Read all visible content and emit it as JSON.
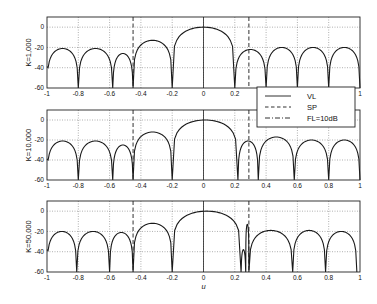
{
  "chart_data": [
    {
      "type": "line",
      "panel": 1,
      "ylabel": "K=1,000",
      "xlabel": "",
      "xlim": [
        -1,
        1
      ],
      "ylim": [
        -60,
        10
      ],
      "xticks": [
        -1,
        -0.8,
        -0.6,
        -0.4,
        -0.2,
        0,
        0.2,
        0.4,
        0.6,
        0.8,
        1
      ],
      "xtick_labels": [
        "-1",
        "-0.8",
        "-0.6",
        "-0.4",
        "-0.2",
        "0",
        "0.2",
        "0.4",
        "0.6",
        "0.8",
        "1"
      ],
      "yticks": [
        -60,
        -40,
        -20,
        0
      ],
      "ytick_labels": [
        "-60",
        "-40",
        "-20",
        "0"
      ],
      "grid": true,
      "vertical_markers": [
        {
          "x": -0.45,
          "style": "SP"
        },
        {
          "x": 0.29,
          "style": "SP"
        }
      ],
      "nulls_u": [
        -1,
        -0.8,
        -0.58,
        -0.45,
        -0.2,
        0.2,
        0.4,
        0.6,
        0.8,
        1
      ],
      "lobe_peaks_db": [
        -21,
        -21,
        -26,
        -13,
        0,
        -22,
        -20,
        -20,
        -20
      ],
      "series": [
        {
          "name": "VL",
          "style": "solid"
        }
      ]
    },
    {
      "type": "line",
      "panel": 2,
      "ylabel": "K=10,000",
      "xlabel": "",
      "xlim": [
        -1,
        1
      ],
      "ylim": [
        -60,
        10
      ],
      "xticks": [
        -1,
        -0.8,
        -0.6,
        -0.4,
        -0.2,
        0,
        0.2,
        0.4,
        0.6,
        0.8,
        1
      ],
      "xtick_labels": [
        "-1",
        "-0.8",
        "-0.6",
        "-0.4",
        "-0.2",
        "0",
        "0.2",
        "0.4",
        "0.6",
        "0.8",
        "1"
      ],
      "yticks": [
        -60,
        -40,
        -20,
        0
      ],
      "ytick_labels": [
        "-60",
        "-40",
        "-20",
        "0"
      ],
      "grid": true,
      "vertical_markers": [
        {
          "x": -0.45,
          "style": "SP"
        },
        {
          "x": 0.29,
          "style": "SP"
        }
      ],
      "nulls_u": [
        -1,
        -0.8,
        -0.58,
        -0.45,
        -0.2,
        0.22,
        0.35,
        0.58,
        0.8,
        1
      ],
      "lobe_peaks_db": [
        -21,
        -21,
        -25,
        -12,
        0,
        -21,
        -17,
        -20,
        -20
      ],
      "series": [
        {
          "name": "VL",
          "style": "solid"
        }
      ]
    },
    {
      "type": "line",
      "panel": 3,
      "ylabel": "K=50,000",
      "xlabel": "u",
      "xlim": [
        -1,
        1
      ],
      "ylim": [
        -60,
        10
      ],
      "xticks": [
        -1,
        -0.8,
        -0.6,
        -0.4,
        -0.2,
        0,
        0.2,
        0.4,
        0.6,
        0.8,
        1
      ],
      "xtick_labels": [
        "-1",
        "-0.8",
        "-0.6",
        "-0.4",
        "-0.2",
        "0",
        "0.2",
        "0.4",
        "0.6",
        "0.8",
        "1"
      ],
      "yticks": [
        -60,
        -40,
        -20,
        0
      ],
      "ytick_labels": [
        "-60",
        "-40",
        "-20",
        "0"
      ],
      "grid": true,
      "vertical_markers": [
        {
          "x": -0.45,
          "style": "SP"
        },
        {
          "x": 0.29,
          "style": "SP"
        }
      ],
      "nulls_u": [
        -1,
        -0.81,
        -0.6,
        -0.45,
        -0.2,
        0.24,
        0.27,
        0.29,
        0.57,
        0.78,
        0.98
      ],
      "lobe_peaks_db": [
        -20,
        -20,
        -21,
        -12,
        0,
        -38,
        -13,
        -19,
        -19
      ],
      "series": [
        {
          "name": "VL",
          "style": "solid"
        }
      ]
    }
  ],
  "legend": {
    "items": [
      {
        "label": "VL",
        "style": "solid"
      },
      {
        "label": "SP",
        "style": "dashed"
      },
      {
        "label": "FL=10dB",
        "style": "dashdot"
      }
    ]
  },
  "colors": {
    "line": "#1a1a1a",
    "grid": "#7a7a7a",
    "axes": "#222222",
    "background": "#ffffff"
  }
}
